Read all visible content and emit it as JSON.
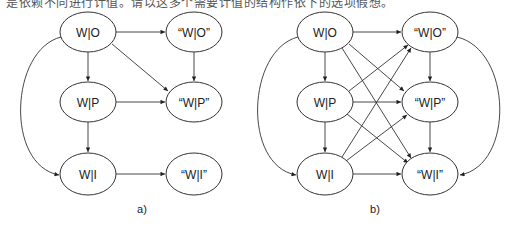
{
  "top_caption": "是依赖不同进行计值。请以这多个需要计值的结构作依下的选项假想。",
  "colors": {
    "stroke": "#333333",
    "text": "#222222",
    "background": "#ffffff"
  },
  "diagrams": [
    {
      "id": "a",
      "caption": "a)",
      "nodes": [
        {
          "id": "WO",
          "label": "W|O",
          "cx": 88,
          "cy": 32
        },
        {
          "id": "qWO",
          "label": "“W|O”",
          "cx": 194,
          "cy": 32
        },
        {
          "id": "WP",
          "label": "W|P",
          "cx": 88,
          "cy": 102
        },
        {
          "id": "qWP",
          "label": "“W|P”",
          "cx": 194,
          "cy": 102
        },
        {
          "id": "WI",
          "label": "W|I",
          "cx": 88,
          "cy": 174
        },
        {
          "id": "qWI",
          "label": "“W|I”",
          "cx": 194,
          "cy": 174
        }
      ],
      "edges": [
        [
          "WO",
          "qWO"
        ],
        [
          "WO",
          "WP"
        ],
        [
          "WO",
          "qWP"
        ],
        [
          "qWO",
          "qWP"
        ],
        [
          "WP",
          "qWP"
        ],
        [
          "WP",
          "WI"
        ],
        [
          "WI",
          "qWI"
        ],
        [
          "WO",
          "WI",
          "curve-left"
        ]
      ]
    },
    {
      "id": "b",
      "caption": "b)",
      "nodes": [
        {
          "id": "WO",
          "label": "W|O",
          "cx": 325,
          "cy": 32
        },
        {
          "id": "qWO",
          "label": "“W|O”",
          "cx": 430,
          "cy": 32
        },
        {
          "id": "WP",
          "label": "W|P",
          "cx": 325,
          "cy": 102
        },
        {
          "id": "qWP",
          "label": "“W|P”",
          "cx": 430,
          "cy": 102
        },
        {
          "id": "WI",
          "label": "W|I",
          "cx": 325,
          "cy": 174
        },
        {
          "id": "qWI",
          "label": "“W|I”",
          "cx": 430,
          "cy": 174
        }
      ],
      "edges": [
        [
          "WO",
          "qWO"
        ],
        [
          "WO",
          "WP"
        ],
        [
          "WO",
          "qWP"
        ],
        [
          "WO",
          "qWI"
        ],
        [
          "WP",
          "qWO"
        ],
        [
          "WP",
          "qWP"
        ],
        [
          "WP",
          "WI"
        ],
        [
          "WP",
          "qWI"
        ],
        [
          "WI",
          "qWO"
        ],
        [
          "WI",
          "qWP"
        ],
        [
          "WI",
          "qWI"
        ],
        [
          "qWO",
          "qWP"
        ],
        [
          "qWP",
          "qWI"
        ],
        [
          "WO",
          "WI",
          "curve-left"
        ],
        [
          "qWO",
          "qWI",
          "curve-right"
        ]
      ]
    }
  ]
}
